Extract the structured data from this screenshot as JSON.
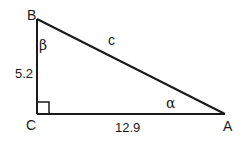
{
  "diagram": {
    "type": "right-triangle",
    "stroke_color": "#1a1a1a",
    "background": "#ffffff",
    "vertices": {
      "A": {
        "label": "A",
        "x": 225,
        "y": 114
      },
      "B": {
        "label": "B",
        "x": 37,
        "y": 19
      },
      "C": {
        "label": "C",
        "x": 37,
        "y": 114
      }
    },
    "right_angle_at": "C",
    "sides": {
      "BC": {
        "label": "5.2"
      },
      "CA": {
        "label": "12.9"
      },
      "AB": {
        "label": "c"
      }
    },
    "angles": {
      "alpha": {
        "label": "α",
        "at": "A"
      },
      "beta": {
        "label": "β",
        "at": "B"
      }
    }
  }
}
